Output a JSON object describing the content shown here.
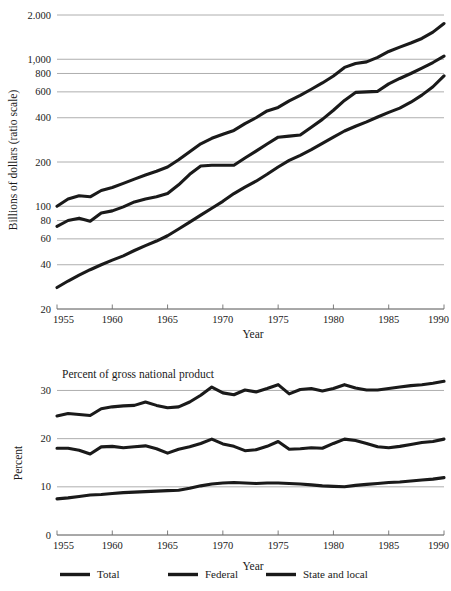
{
  "figure": {
    "background": "#ffffff",
    "ink_color": "#1a1a1a",
    "grid_color": "#9a9a9a"
  },
  "legend": {
    "items": [
      {
        "label": "Total"
      },
      {
        "label": "Federal"
      },
      {
        "label": "State and local"
      }
    ]
  },
  "chart_data": [
    {
      "type": "line",
      "id": "government-spending-dollars",
      "title": "",
      "xlabel": "Year",
      "ylabel": "Billions of dollars (ratio scale)",
      "yscale": "log",
      "ylim": [
        20,
        2000
      ],
      "xlim": [
        1955,
        1990
      ],
      "grid": true,
      "legend_position": "below-figure",
      "xticks": [
        1955,
        1960,
        1965,
        1970,
        1975,
        1980,
        1985,
        1990
      ],
      "xticklabels": [
        "1955",
        "1960",
        "1965",
        "1970",
        "1975",
        "1980",
        "1985",
        "1990"
      ],
      "yticks": [
        20,
        40,
        60,
        80,
        100,
        200,
        400,
        600,
        800,
        1000,
        2000
      ],
      "yticklabels": [
        "20",
        "40",
        "60",
        "80",
        "100",
        "200",
        "400",
        "600",
        "800",
        "1,000",
        "2.000"
      ],
      "x": [
        1955,
        1956,
        1957,
        1958,
        1959,
        1960,
        1961,
        1962,
        1963,
        1964,
        1965,
        1966,
        1967,
        1968,
        1969,
        1970,
        1971,
        1972,
        1973,
        1974,
        1975,
        1976,
        1977,
        1978,
        1979,
        1980,
        1981,
        1982,
        1983,
        1984,
        1985,
        1986,
        1987,
        1988,
        1989,
        1990
      ],
      "series": [
        {
          "name": "Total",
          "values": [
            100,
            112,
            118,
            116,
            128,
            134,
            143,
            153,
            163,
            173,
            185,
            207,
            235,
            266,
            290,
            309,
            328,
            365,
            400,
            445,
            470,
            521,
            567,
            625,
            690,
            770,
            880,
            935,
            960,
            1030,
            1130,
            1210,
            1290,
            1385,
            1530,
            1750
          ]
        },
        {
          "name": "Federal",
          "values": [
            73,
            80,
            83,
            79,
            90,
            93,
            99,
            107,
            112,
            116,
            122,
            140,
            165,
            188,
            190,
            190,
            190,
            213,
            237,
            265,
            295,
            300,
            305,
            345,
            390,
            450,
            525,
            595,
            600,
            605,
            680,
            740,
            800,
            870,
            950,
            1050
          ]
        },
        {
          "name": "State and local",
          "values": [
            28,
            31,
            34,
            37,
            40,
            43,
            46,
            50,
            54,
            58,
            63,
            70,
            78,
            87,
            97,
            108,
            122,
            135,
            148,
            165,
            185,
            205,
            222,
            243,
            268,
            295,
            325,
            350,
            375,
            405,
            435,
            465,
            510,
            570,
            650,
            770
          ]
        }
      ]
    },
    {
      "type": "line",
      "id": "government-spending-percent-gnp",
      "title": "Percent of gross national product",
      "xlabel": "Year",
      "ylabel": "Percent",
      "yscale": "linear",
      "ylim": [
        0,
        33
      ],
      "xlim": [
        1955,
        1990
      ],
      "grid": true,
      "legend_position": "below-figure",
      "xticks": [
        1955,
        1960,
        1965,
        1970,
        1975,
        1980,
        1985,
        1990
      ],
      "xticklabels": [
        "1955",
        "1960",
        "1965",
        "1970",
        "1975",
        "1980",
        "1985",
        "1990"
      ],
      "yticks": [
        0,
        10,
        20,
        30
      ],
      "yticklabels": [
        "0",
        "10",
        "20",
        "30"
      ],
      "x": [
        1955,
        1956,
        1957,
        1958,
        1959,
        1960,
        1961,
        1962,
        1963,
        1964,
        1965,
        1966,
        1967,
        1968,
        1969,
        1970,
        1971,
        1972,
        1973,
        1974,
        1975,
        1976,
        1977,
        1978,
        1979,
        1980,
        1981,
        1982,
        1983,
        1984,
        1985,
        1986,
        1987,
        1988,
        1989,
        1990
      ],
      "series": [
        {
          "name": "Total",
          "values": [
            24.7,
            25.2,
            25.0,
            24.8,
            26.2,
            26.6,
            26.8,
            26.9,
            27.6,
            26.9,
            26.4,
            26.6,
            27.6,
            29.0,
            30.7,
            29.5,
            29.1,
            30.1,
            29.7,
            30.4,
            31.2,
            29.3,
            30.2,
            30.4,
            29.9,
            30.4,
            31.2,
            30.5,
            30.1,
            30.1,
            30.4,
            30.7,
            31.0,
            31.2,
            31.5,
            31.9
          ]
        },
        {
          "name": "Federal",
          "values": [
            18.0,
            18.0,
            17.6,
            16.8,
            18.3,
            18.4,
            18.1,
            18.3,
            18.5,
            17.9,
            17.0,
            17.8,
            18.3,
            19.0,
            19.9,
            18.9,
            18.4,
            17.5,
            17.7,
            18.4,
            19.4,
            17.8,
            17.9,
            18.1,
            18.0,
            19.0,
            19.9,
            19.6,
            19.0,
            18.3,
            18.1,
            18.4,
            18.8,
            19.2,
            19.4,
            19.9
          ]
        },
        {
          "name": "State and local",
          "values": [
            7.5,
            7.7,
            8.0,
            8.3,
            8.4,
            8.6,
            8.8,
            8.9,
            9.0,
            9.1,
            9.2,
            9.3,
            9.7,
            10.2,
            10.6,
            10.8,
            10.9,
            10.8,
            10.7,
            10.8,
            10.8,
            10.7,
            10.6,
            10.4,
            10.2,
            10.1,
            10.0,
            10.3,
            10.5,
            10.7,
            10.9,
            11.0,
            11.2,
            11.4,
            11.6,
            11.9
          ]
        }
      ]
    }
  ]
}
